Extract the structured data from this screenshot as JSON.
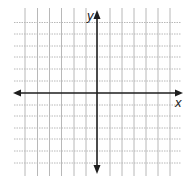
{
  "diagram": {
    "type": "coordinate-plane",
    "colors": {
      "background": "#ffffff",
      "grid": "#b8b8b8",
      "axis": "#1e1e1e"
    },
    "grid": {
      "left": 14,
      "right": 181,
      "top": 8,
      "bottom": 176,
      "vertical_lines_x": [
        25,
        37.5,
        49.5,
        61.5,
        74,
        86,
        110,
        122,
        134,
        146,
        158,
        170
      ],
      "horizontal_lines_y": [
        22.5,
        34,
        46,
        57,
        69,
        81,
        105,
        116,
        128,
        139,
        151,
        163
      ]
    },
    "axes": {
      "origin": {
        "x": 97,
        "y": 93
      },
      "x_axis": {
        "from": 13,
        "to": 183,
        "label": "x"
      },
      "y_axis": {
        "from": 10,
        "to": 174,
        "label": "y"
      }
    }
  }
}
